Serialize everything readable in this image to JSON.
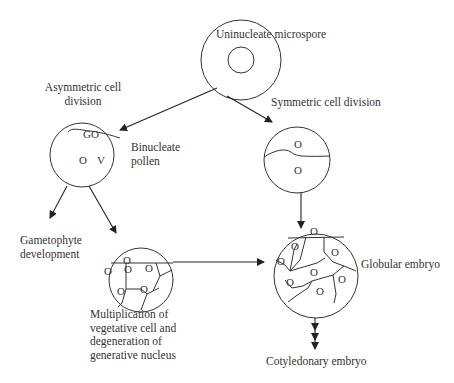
{
  "diagram": {
    "nodes": {
      "uninucleate": {
        "label": "Uninucleate microspore"
      },
      "binucleate": {
        "label_line1": "Binucleate",
        "label_line2": "pollen",
        "glyphs": {
          "go": "GO",
          "o": "O",
          "v": "V"
        }
      },
      "symmetric": {
        "glyphs": {
          "o1": "O",
          "o2": "O"
        }
      },
      "gametophyte": {
        "label_line1": "Gametophyte",
        "label_line2": "development"
      },
      "multiplication": {
        "label_line1": "Multiplication of",
        "label_line2": "vegetative cell and",
        "label_line3": "degeneration of",
        "label_line4": "generative nucleus",
        "nucleus_glyph": "O"
      },
      "globular": {
        "label": "Globular embryo",
        "nucleus_glyph": "O"
      },
      "cotyledonary": {
        "label": "Cotyledonary embryo"
      }
    },
    "edges": {
      "asymmetric": {
        "label_line1": "Asymmetric cell",
        "label_line2": "division"
      },
      "symmetric": {
        "label": "Symmetric cell division"
      }
    },
    "colors": {
      "stroke": "#222222",
      "text": "#333333",
      "background": "#ffffff"
    }
  }
}
